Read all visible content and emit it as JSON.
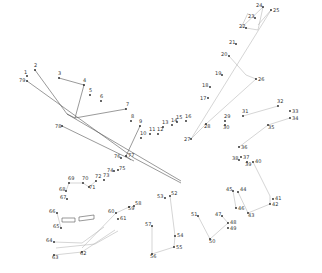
{
  "dots": [
    {
      "n": "1"
    },
    {
      "n": "2"
    },
    {
      "n": "3"
    },
    {
      "n": "4"
    },
    {
      "n": "5"
    },
    {
      "n": "6"
    },
    {
      "n": "7"
    },
    {
      "n": "8"
    },
    {
      "n": "9"
    },
    {
      "n": "10"
    },
    {
      "n": "11"
    },
    {
      "n": "12"
    },
    {
      "n": "13"
    },
    {
      "n": "14"
    },
    {
      "n": "15"
    },
    {
      "n": "16"
    },
    {
      "n": "17"
    },
    {
      "n": "18"
    },
    {
      "n": "19"
    },
    {
      "n": "20"
    },
    {
      "n": "21"
    },
    {
      "n": "22"
    },
    {
      "n": "23"
    },
    {
      "n": "24"
    },
    {
      "n": "25"
    },
    {
      "n": "26"
    },
    {
      "n": "27"
    },
    {
      "n": "28"
    },
    {
      "n": "29"
    },
    {
      "n": "30"
    },
    {
      "n": "31"
    },
    {
      "n": "32"
    },
    {
      "n": "33"
    },
    {
      "n": "34"
    },
    {
      "n": "35"
    },
    {
      "n": "36"
    },
    {
      "n": "37"
    },
    {
      "n": "38"
    },
    {
      "n": "39"
    },
    {
      "n": "40"
    },
    {
      "n": "41"
    },
    {
      "n": "42"
    },
    {
      "n": "43"
    },
    {
      "n": "44"
    },
    {
      "n": "45"
    },
    {
      "n": "46"
    },
    {
      "n": "47"
    },
    {
      "n": "48"
    },
    {
      "n": "49"
    },
    {
      "n": "50"
    },
    {
      "n": "51"
    },
    {
      "n": "52"
    },
    {
      "n": "53"
    },
    {
      "n": "54"
    },
    {
      "n": "55"
    },
    {
      "n": "56"
    },
    {
      "n": "57"
    },
    {
      "n": "58"
    },
    {
      "n": "59"
    },
    {
      "n": "60"
    },
    {
      "n": "61"
    },
    {
      "n": "62"
    },
    {
      "n": "63"
    },
    {
      "n": "64"
    },
    {
      "n": "65"
    },
    {
      "n": "66"
    },
    {
      "n": "67"
    },
    {
      "n": "68"
    },
    {
      "n": "69"
    },
    {
      "n": "70"
    },
    {
      "n": "71"
    },
    {
      "n": "72"
    },
    {
      "n": "73"
    },
    {
      "n": "74"
    },
    {
      "n": "75"
    },
    {
      "n": "76"
    },
    {
      "n": "77"
    },
    {
      "n": "78"
    },
    {
      "n": "79"
    }
  ]
}
